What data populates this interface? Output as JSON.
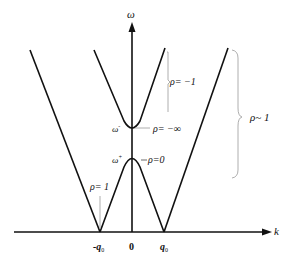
{
  "diagram": {
    "title": "",
    "axes": {
      "y_label": "ω",
      "x_label": "k"
    },
    "x_ticks": [
      {
        "label": "-q",
        "sub": "0",
        "x": 100
      },
      {
        "label": "0",
        "sub": "",
        "x": 132
      },
      {
        "label": "q",
        "sub": "0",
        "x": 164
      }
    ],
    "points": {
      "omega_minus": {
        "base": "ω",
        "sup": "-"
      },
      "omega_plus": {
        "base": "ω",
        "sup": "+"
      }
    },
    "annotations": {
      "rho_minus_inf": "ρ= −∞",
      "rho_zero": "ρ=0",
      "rho_minus_one": "ρ= −1",
      "rho_approx_one": "ρ~ 1",
      "rho_one": "ρ= 1"
    },
    "colors": {
      "line": "#111111",
      "bracket": "#888888",
      "background": "#ffffff"
    }
  }
}
